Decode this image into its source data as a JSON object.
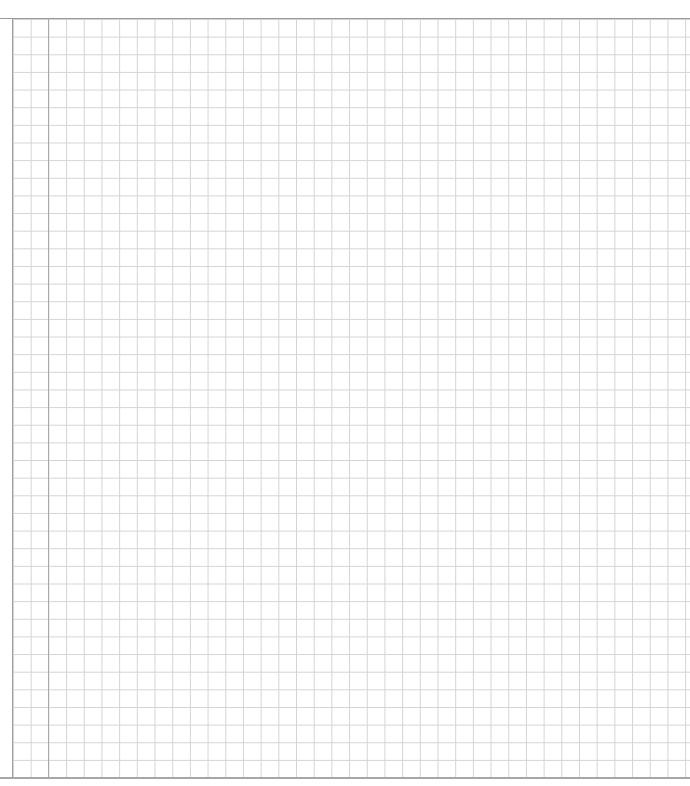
{
  "page": {
    "type": "grid-paper",
    "grid_color": "#d4d4d4",
    "rule_color": "#9a9a9a",
    "background": "#ffffff"
  }
}
